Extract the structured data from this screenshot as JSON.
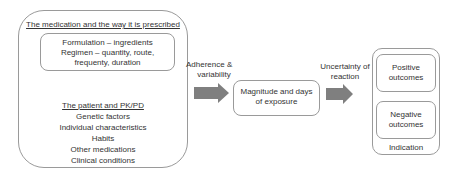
{
  "diagram": {
    "left_panel": {
      "heading": "The medication and the way it is prescribed",
      "prescription_box": {
        "lines": [
          "Formulation – ingredients",
          "Regimen – quantity, route,",
          "frequenty, duration"
        ]
      },
      "patient_heading": "The patient and PK/PD",
      "patient_factors": [
        "Genetic factors",
        "Individual characteristics",
        "Habits",
        "Other medications",
        "Clinical conditions"
      ]
    },
    "arrow1": {
      "label_lines": [
        "Adherence &",
        "variability"
      ],
      "color": "#7f7f7f"
    },
    "middle_box": {
      "lines": [
        "Magnitude and days",
        "of exposure"
      ]
    },
    "arrow2": {
      "label_lines": [
        "Uncertainty of",
        "reaction"
      ],
      "color": "#7f7f7f"
    },
    "right_panel": {
      "positive": [
        "Positive",
        "outcomes"
      ],
      "negative": [
        "Negative",
        "outcomes"
      ],
      "footer": "Indication"
    }
  }
}
